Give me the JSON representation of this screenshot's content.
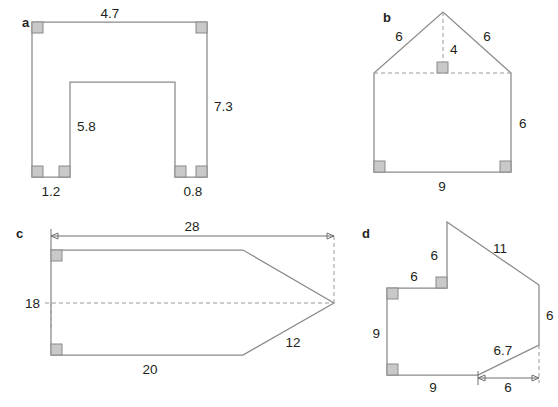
{
  "page": {
    "background_color": "#ffffff",
    "stroke_color": "#8a8a8a",
    "dash_color": "#9a9a9a",
    "right_angle_fill": "#c9c9c9",
    "text_color": "#231f20",
    "width": 558,
    "height": 407
  },
  "figures": [
    {
      "id": "a",
      "letter": "a",
      "name": "u-shaped-polygon",
      "description": "U-shaped (inverted-U) rectilinear polygon with rectangular notch cut from the bottom",
      "labels": [
        {
          "key": "top",
          "text": "4.7"
        },
        {
          "key": "right",
          "text": "7.3"
        },
        {
          "key": "notch",
          "text": "5.8"
        },
        {
          "key": "left_foot",
          "text": "1.2"
        },
        {
          "key": "right_foot",
          "text": "0.8"
        }
      ],
      "right_angle_count": 6
    },
    {
      "id": "b",
      "letter": "b",
      "name": "house-pentagon",
      "description": "House shape: rectangle with triangular roof, dashed base line and dashed roof height",
      "labels": [
        {
          "key": "roof_left",
          "text": "6"
        },
        {
          "key": "roof_height",
          "text": "4"
        },
        {
          "key": "roof_right",
          "text": "6"
        },
        {
          "key": "right_side",
          "text": "6"
        },
        {
          "key": "base",
          "text": "9"
        }
      ],
      "right_angle_count": 3
    },
    {
      "id": "c",
      "letter": "c",
      "name": "arrow-pentagon",
      "description": "Arrow/pentagon shape with overall width dimension arrow on top and dashed axis",
      "labels": [
        {
          "key": "overall_width",
          "text": "28"
        },
        {
          "key": "height",
          "text": "18"
        },
        {
          "key": "bottom",
          "text": "20"
        },
        {
          "key": "lower_slant",
          "text": "12"
        }
      ],
      "right_angle_count": 2
    },
    {
      "id": "d",
      "letter": "d",
      "name": "stepped-polygon",
      "description": "Irregular stepped polygon with a notch at the top-left and a slanted lower-right edge",
      "labels": [
        {
          "key": "step_vertical",
          "text": "6"
        },
        {
          "key": "step_horizontal",
          "text": "6"
        },
        {
          "key": "long_slant",
          "text": "11"
        },
        {
          "key": "left_side",
          "text": "9"
        },
        {
          "key": "right_side",
          "text": "6"
        },
        {
          "key": "lower_slant",
          "text": "6.7"
        },
        {
          "key": "bottom",
          "text": "9"
        },
        {
          "key": "slant_run",
          "text": "6"
        }
      ],
      "right_angle_count": 4
    }
  ]
}
